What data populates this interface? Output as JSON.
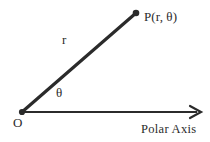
{
  "figure": {
    "background_color": "#ffffff",
    "ink_color": "#2b2b2b",
    "width": 210,
    "height": 142
  },
  "labels": {
    "point_label": "P(r, θ)",
    "radius_label": "r",
    "angle_label": "θ",
    "origin_label": "O",
    "axis_label": "Polar Axis"
  },
  "geometry": {
    "origin": {
      "x": 22,
      "y": 112
    },
    "point_P": {
      "x": 136,
      "y": 13
    },
    "axis_start": {
      "x": 22,
      "y": 112
    },
    "axis_end": {
      "x": 201,
      "y": 112
    },
    "radius_stroke_width": 3.2,
    "axis_stroke_width": 2.2,
    "origin_dot_radius": 3.1,
    "point_dot_radius": 3.3,
    "arrowhead": {
      "style": "open-v",
      "length": 11,
      "half_width": 6
    }
  },
  "chart_data": {
    "type": "scatter",
    "xlabel": "Polar Axis",
    "ylabel": "",
    "annotations": [
      "P(r, θ)",
      "r",
      "θ",
      "O",
      "Polar Axis"
    ]
  }
}
